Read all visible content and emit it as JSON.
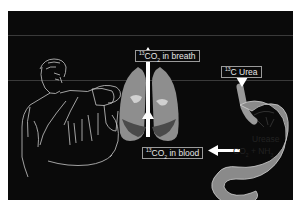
{
  "figure": {
    "background_color": "#ffffff",
    "panel_color": "#0a0a0a",
    "labels": {
      "breath": {
        "isotope": "13",
        "molecule": "CO",
        "subscript": "2",
        "text": " in breath"
      },
      "urea": {
        "isotope": "13",
        "text": "C Urea"
      },
      "blood": {
        "isotope": "13",
        "molecule": "CO",
        "subscript": "2",
        "text": " in blood"
      },
      "urease": {
        "text": "Urease"
      },
      "products": {
        "co": "CO",
        "co_sub": "2",
        "plus": " + NH",
        "nh_sub": "3"
      }
    },
    "elements": [
      {
        "name": "man-drinking",
        "description": "line drawing of man drinking from a cup"
      },
      {
        "name": "lungs",
        "description": "gray shaded lungs with trachea"
      },
      {
        "name": "stomach",
        "description": "stomach and duodenum outline"
      },
      {
        "name": "arrows",
        "description": "white arrows showing CO2 flow from stomach to blood to breath"
      }
    ]
  }
}
